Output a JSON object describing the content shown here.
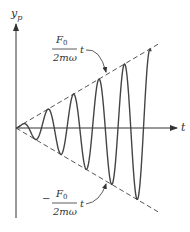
{
  "figure": {
    "width": 190,
    "height": 232,
    "colors": {
      "axis": "#333333",
      "curve": "#444444",
      "envelope": "#555555",
      "text": "#333333"
    },
    "y_axis_label": {
      "main": "y",
      "sub": "p"
    },
    "x_axis_label": "t",
    "upper_envelope_label": {
      "numerator": "F",
      "numerator_sub": "0",
      "denominator": "2mω",
      "suffix": "t",
      "sign": ""
    },
    "lower_envelope_label": {
      "numerator": "F",
      "numerator_sub": "0",
      "denominator": "2mω",
      "suffix": "t",
      "sign": "−"
    }
  },
  "chart_data": {
    "type": "line",
    "xlabel": "t",
    "ylabel": "y_p",
    "grid": false,
    "legend": null,
    "origin_px": [
      16,
      128
    ],
    "x_axis_end_px": 178,
    "y_axis_top_px": 22,
    "y_axis_bottom_px": 218,
    "envelope_slope": 0.59,
    "envelope_end_x_px": 158,
    "curve_end_x_px": 151,
    "period_px": 25.5,
    "series": [
      {
        "name": "y_p(t)",
        "style": "solid"
      },
      {
        "name": "+(F0/2mω) t",
        "style": "dashed"
      },
      {
        "name": "−(F0/2mω) t",
        "style": "dashed"
      }
    ],
    "annotations": [
      {
        "text": "F0/(2mω) t",
        "points_to": "upper envelope"
      },
      {
        "text": "−F0/(2mω) t",
        "points_to": "lower envelope"
      }
    ]
  }
}
